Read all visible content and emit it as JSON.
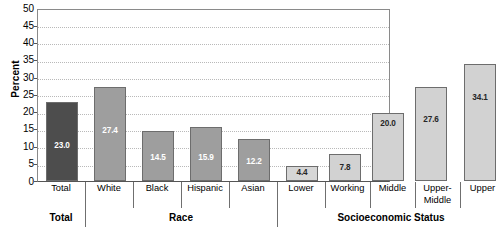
{
  "chart_data": {
    "type": "bar",
    "title": "",
    "xlabel": "",
    "ylabel": "Percent",
    "ylim": [
      0,
      50
    ],
    "ytick_step": 5,
    "yticks": [
      "50",
      "45",
      "40",
      "35",
      "30",
      "25",
      "20",
      "15",
      "10",
      "5",
      "0"
    ],
    "grid": true,
    "legend": "none",
    "categories": [
      "Total",
      "White",
      "Black",
      "Hispanic",
      "Asian",
      "Lower",
      "Working",
      "Middle",
      "Upper-Middle",
      "Upper"
    ],
    "values": [
      23.0,
      27.4,
      14.5,
      15.9,
      12.2,
      4.4,
      7.8,
      20.0,
      27.6,
      34.1
    ],
    "value_labels": [
      "23.0",
      "27.4",
      "14.5",
      "15.9",
      "12.2",
      "4.4",
      "7.8",
      "20.0",
      "27.6",
      "34.1"
    ],
    "groups": [
      {
        "label": "Total",
        "members": [
          "Total"
        ]
      },
      {
        "label": "Race",
        "members": [
          "White",
          "Black",
          "Hispanic",
          "Asian"
        ]
      },
      {
        "label": "Socioeconomic Status",
        "members": [
          "Lower",
          "Working",
          "Middle",
          "Upper-Middle",
          "Upper"
        ]
      }
    ],
    "bar_colors": [
      "#4d4d4d",
      "#9e9e9e",
      "#9e9e9e",
      "#9e9e9e",
      "#9e9e9e",
      "#d6d6d6",
      "#d2d2d2",
      "#d2d2d2",
      "#d2d2d2",
      "#d2d2d2"
    ],
    "value_label_colors": [
      "#ffffff",
      "#ffffff",
      "#ffffff",
      "#ffffff",
      "#ffffff",
      "#262626",
      "#262626",
      "#262626",
      "#262626",
      "#262626"
    ]
  },
  "axis": {
    "y_title": "Percent"
  },
  "xlabels": {
    "total": "Total",
    "white": "White",
    "black": "Black",
    "hispanic": "Hispanic",
    "asian": "Asian",
    "lower": "Lower",
    "working": "Working",
    "middle": "Middle",
    "upper_middle_line1": "Upper-",
    "upper_middle_line2": "Middle",
    "upper": "Upper"
  },
  "group_labels": {
    "total": "Total",
    "race": "Race",
    "ses": "Socioeconomic Status"
  },
  "values": {
    "total": "23.0",
    "white": "27.4",
    "black": "14.5",
    "hispanic": "15.9",
    "asian": "12.2",
    "lower": "4.4",
    "working": "7.8",
    "middle": "20.0",
    "upper_middle": "27.6",
    "upper": "34.1"
  },
  "yticks": {
    "t50": "50",
    "t45": "45",
    "t40": "40",
    "t35": "35",
    "t30": "30",
    "t25": "25",
    "t20": "20",
    "t15": "15",
    "t10": "10",
    "t5": "5",
    "t0": "0"
  },
  "colors": {
    "bar_dark": "#4d4d4d",
    "bar_medium": "#9e9e9e",
    "bar_light": "#d2d2d2",
    "grid": "#b9b9b9",
    "axis": "#555555"
  }
}
